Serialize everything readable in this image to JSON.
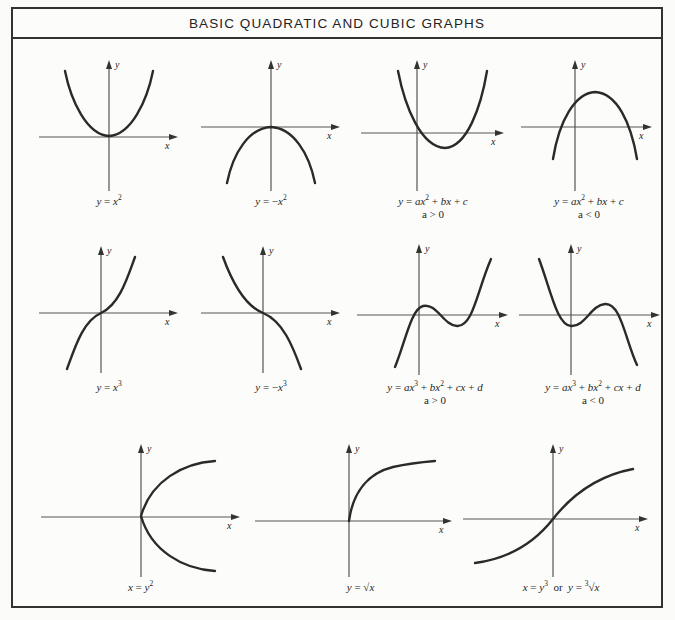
{
  "page": {
    "title": "BASIC QUADRATIC AND CUBIC GRAPHS",
    "background_color": "#fbfbfa",
    "frame_color": "#33322f",
    "curve_color": "#2a2a28",
    "axis_color": "#55554f"
  },
  "axes": {
    "x_label": "x",
    "y_label": "y"
  },
  "chart_data": {
    "type": "line",
    "title": "BASIC QUADRATIC AND CUBIC GRAPHS",
    "xlabel": "x",
    "ylabel": "y",
    "grid": false,
    "legend": "none",
    "panels": [
      {
        "id": "y-equals-x-squared",
        "row": 1,
        "col": 1,
        "equation_html": "<i>y</i> = <i>x</i><sup>2</sup>",
        "equation_text": "y = x^2",
        "condition": "",
        "curve_type": "parabola-up",
        "vertex": [
          0,
          0
        ],
        "axis_ranges": {
          "x": [
            -3,
            3
          ],
          "y": [
            -1,
            9
          ]
        },
        "points": [
          [
            -2.6,
            6.76
          ],
          [
            -2,
            4
          ],
          [
            -1.5,
            2.25
          ],
          [
            -1,
            1
          ],
          [
            -0.5,
            0.25
          ],
          [
            0,
            0
          ],
          [
            0.5,
            0.25
          ],
          [
            1,
            1
          ],
          [
            1.5,
            2.25
          ],
          [
            2,
            4
          ],
          [
            2.6,
            6.76
          ]
        ]
      },
      {
        "id": "y-equals-negative-x-squared",
        "row": 1,
        "col": 2,
        "equation_html": "<i>y</i> = &minus;<i>x</i><sup>2</sup>",
        "equation_text": "y = -x^2",
        "condition": "",
        "curve_type": "parabola-down",
        "vertex": [
          0,
          0
        ],
        "axis_ranges": {
          "x": [
            -3,
            3
          ],
          "y": [
            -9,
            1
          ]
        },
        "points": [
          [
            -2.6,
            -6.76
          ],
          [
            -2,
            -4
          ],
          [
            -1.5,
            -2.25
          ],
          [
            -1,
            -1
          ],
          [
            -0.5,
            -0.25
          ],
          [
            0,
            0
          ],
          [
            0.5,
            -0.25
          ],
          [
            1,
            -1
          ],
          [
            1.5,
            -2.25
          ],
          [
            2,
            -4
          ],
          [
            2.6,
            -6.76
          ]
        ]
      },
      {
        "id": "quadratic-general-a-positive",
        "row": 1,
        "col": 3,
        "equation_html": "<i>y</i> = <i>ax</i><sup>2</sup> + <i>bx</i> + <i>c</i>",
        "equation_text": "y = ax^2 + bx + c",
        "condition": "a > 0",
        "curve_type": "parabola-up-shifted",
        "vertex": [
          1.1,
          -1.2
        ],
        "axis_ranges": {
          "x": [
            -2,
            4
          ],
          "y": [
            -2,
            8
          ]
        },
        "points": [
          [
            -1.4,
            5.8
          ],
          [
            -1,
            4.4
          ],
          [
            -0.5,
            2.4
          ],
          [
            0,
            0.8
          ],
          [
            0.5,
            -0.6
          ],
          [
            1.1,
            -1.2
          ],
          [
            1.6,
            -0.8
          ],
          [
            2.1,
            0.4
          ],
          [
            2.6,
            2.2
          ],
          [
            3.1,
            4.6
          ],
          [
            3.5,
            6.6
          ]
        ]
      },
      {
        "id": "quadratic-general-a-negative",
        "row": 1,
        "col": 4,
        "equation_html": "<i>y</i> = <i>ax</i><sup>2</sup> + <i>bx</i> + <i>c</i>",
        "equation_text": "y = ax^2 + bx + c",
        "condition": "a < 0",
        "curve_type": "parabola-down-shifted",
        "vertex": [
          0.8,
          2.2
        ],
        "axis_ranges": {
          "x": [
            -2,
            4
          ],
          "y": [
            -4,
            4
          ]
        },
        "points": [
          [
            -1.2,
            -2.4
          ],
          [
            -0.8,
            -1.0
          ],
          [
            -0.4,
            0.3
          ],
          [
            0,
            1.2
          ],
          [
            0.4,
            1.9
          ],
          [
            0.8,
            2.2
          ],
          [
            1.4,
            1.9
          ],
          [
            1.9,
            1.0
          ],
          [
            2.4,
            -0.3
          ],
          [
            2.9,
            -1.8
          ],
          [
            3.2,
            -2.8
          ]
        ]
      },
      {
        "id": "y-equals-x-cubed",
        "row": 2,
        "col": 1,
        "equation_html": "<i>y</i> = <i>x</i><sup>3</sup>",
        "equation_text": "y = x^3",
        "condition": "",
        "curve_type": "cubic-increasing",
        "inflection": [
          0,
          0
        ],
        "axis_ranges": {
          "x": [
            -2,
            2
          ],
          "y": [
            -8,
            8
          ]
        },
        "points": [
          [
            -1.8,
            -5.8
          ],
          [
            -1.4,
            -2.7
          ],
          [
            -1,
            -1
          ],
          [
            -0.6,
            -0.22
          ],
          [
            0,
            0
          ],
          [
            0.6,
            0.22
          ],
          [
            1,
            1
          ],
          [
            1.4,
            2.7
          ],
          [
            1.8,
            5.8
          ]
        ]
      },
      {
        "id": "y-equals-negative-x-cubed",
        "row": 2,
        "col": 2,
        "equation_html": "<i>y</i> = &minus;<i>x</i><sup>3</sup>",
        "equation_text": "y = -x^3",
        "condition": "",
        "curve_type": "cubic-decreasing",
        "inflection": [
          0,
          0
        ],
        "axis_ranges": {
          "x": [
            -2,
            2
          ],
          "y": [
            -8,
            8
          ]
        },
        "points": [
          [
            -1.8,
            5.8
          ],
          [
            -1.4,
            2.7
          ],
          [
            -1,
            1
          ],
          [
            -0.6,
            0.22
          ],
          [
            0,
            0
          ],
          [
            0.6,
            -0.22
          ],
          [
            1,
            -1
          ],
          [
            1.4,
            -2.7
          ],
          [
            1.8,
            -5.8
          ]
        ]
      },
      {
        "id": "cubic-general-a-positive",
        "row": 2,
        "col": 3,
        "equation_html": "<i>y</i> = <i>ax</i><sup>3</sup> + <i>bx</i><sup>2</sup> + <i>cx</i> + <i>d</i>",
        "equation_text": "y = ax^3 + bx^2 + cx + d",
        "condition": "a > 0",
        "curve_type": "cubic-two-turning-up",
        "local_max": [
          0.1,
          0.9
        ],
        "local_min": [
          1.6,
          -0.8
        ],
        "axis_ranges": {
          "x": [
            -2,
            3
          ],
          "y": [
            -4,
            4
          ]
        },
        "points": [
          [
            -1.2,
            -3.4
          ],
          [
            -0.8,
            -1.6
          ],
          [
            -0.4,
            0.1
          ],
          [
            0.1,
            0.9
          ],
          [
            0.6,
            0.5
          ],
          [
            1.1,
            -0.4
          ],
          [
            1.6,
            -0.8
          ],
          [
            2.0,
            -0.2
          ],
          [
            2.4,
            1.4
          ],
          [
            2.7,
            3.2
          ]
        ]
      },
      {
        "id": "cubic-general-a-negative",
        "row": 2,
        "col": 4,
        "equation_html": "<i>y</i> = <i>ax</i><sup>3</sup> + <i>bx</i><sup>2</sup> + <i>cx</i> + <i>d</i>",
        "equation_text": "y = ax^3 + bx^2 + cx + d",
        "condition": "a < 0",
        "curve_type": "cubic-two-turning-down",
        "local_min": [
          0.1,
          -0.8
        ],
        "local_max": [
          1.6,
          0.9
        ],
        "axis_ranges": {
          "x": [
            -2,
            3
          ],
          "y": [
            -4,
            4
          ]
        },
        "points": [
          [
            -1.2,
            3.4
          ],
          [
            -0.8,
            1.6
          ],
          [
            -0.4,
            -0.1
          ],
          [
            0.1,
            -0.8
          ],
          [
            0.6,
            -0.5
          ],
          [
            1.1,
            0.4
          ],
          [
            1.6,
            0.9
          ],
          [
            2.0,
            0.2
          ],
          [
            2.4,
            -1.4
          ],
          [
            2.7,
            -3.2
          ]
        ]
      },
      {
        "id": "x-equals-y-squared",
        "row": 3,
        "col": 1,
        "equation_html": "<i>x</i> = <i>y</i><sup>2</sup>",
        "equation_text": "x = y^2",
        "condition": "",
        "curve_type": "parabola-right",
        "vertex": [
          0,
          0
        ],
        "axis_ranges": {
          "x": [
            -1,
            6
          ],
          "y": [
            -3,
            3
          ]
        },
        "points": [
          [
            5.8,
            2.4
          ],
          [
            4,
            2
          ],
          [
            2.25,
            1.5
          ],
          [
            1,
            1
          ],
          [
            0.25,
            0.5
          ],
          [
            0,
            0
          ],
          [
            0.25,
            -0.5
          ],
          [
            1,
            -1
          ],
          [
            2.25,
            -1.5
          ],
          [
            4,
            -2
          ],
          [
            5.8,
            -2.4
          ]
        ]
      },
      {
        "id": "y-equals-sqrt-x",
        "row": 3,
        "col": 2,
        "equation_html": "<i>y</i> = &radic;<span class=\"rad\"><i>x</i></span>",
        "equation_text": "y = sqrt(x)",
        "condition": "",
        "curve_type": "square-root",
        "origin": [
          0,
          0
        ],
        "axis_ranges": {
          "x": [
            -1,
            6
          ],
          "y": [
            -1,
            3
          ]
        },
        "points": [
          [
            0,
            0
          ],
          [
            0.25,
            0.5
          ],
          [
            1,
            1
          ],
          [
            2.25,
            1.5
          ],
          [
            4,
            2
          ],
          [
            5.8,
            2.41
          ]
        ]
      },
      {
        "id": "x-equals-y-cubed",
        "row": 3,
        "col": 3,
        "equation_html": "<i>x</i> = <i>y</i><sup>3</sup> &nbsp;or&nbsp; <i>y</i> = <sup>3</sup>&radic;<span class=\"rad\"><i>x</i></span>",
        "equation_text": "x = y^3 or y = cbrt(x)",
        "condition": "",
        "curve_type": "cube-root",
        "inflection": [
          0,
          0
        ],
        "axis_ranges": {
          "x": [
            -6,
            6
          ],
          "y": [
            -3,
            3
          ]
        },
        "points": [
          [
            -5.8,
            -1.8
          ],
          [
            -3.4,
            -1.5
          ],
          [
            -1,
            -1
          ],
          [
            -0.22,
            -0.6
          ],
          [
            0,
            0
          ],
          [
            0.22,
            0.6
          ],
          [
            1,
            1
          ],
          [
            3.4,
            1.5
          ],
          [
            5.8,
            1.8
          ]
        ]
      }
    ]
  }
}
